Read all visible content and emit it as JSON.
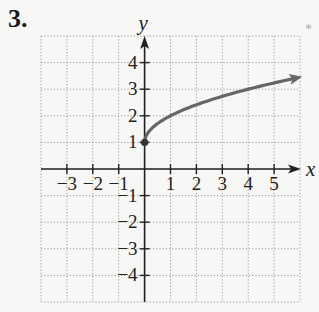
{
  "problem": {
    "number": "3.",
    "marker": "*"
  },
  "chart_data": {
    "type": "line",
    "title": "",
    "xlabel": "x",
    "ylabel": "y",
    "xlim": [
      -4,
      6
    ],
    "ylim": [
      -5,
      5
    ],
    "grid": true,
    "grid_style": "dotted",
    "x_ticks": [
      -3,
      -2,
      -1,
      1,
      2,
      3,
      4,
      5
    ],
    "x_tick_labels": [
      "−3",
      "−2",
      "−1",
      "1",
      "2",
      "3",
      "4",
      "5"
    ],
    "y_ticks": [
      4,
      3,
      2,
      1,
      -1,
      -2,
      -3,
      -4
    ],
    "y_tick_labels": [
      "4",
      "3",
      "2",
      "1",
      "−1",
      "−2",
      "−3",
      "−4"
    ],
    "series": [
      {
        "name": "f(x) = √x + 1",
        "start_point": {
          "x": 0,
          "y": 1,
          "closed": true
        },
        "end": "arrow",
        "x": [
          0,
          0.25,
          0.5,
          1,
          1.5,
          2,
          2.5,
          3,
          3.5,
          4,
          4.5,
          5,
          5.5,
          5.9
        ],
        "y": [
          1,
          1.5,
          1.71,
          2,
          2.22,
          2.41,
          2.58,
          2.73,
          2.87,
          3,
          3.12,
          3.24,
          3.35,
          3.43
        ],
        "color": "#666666"
      }
    ],
    "colors": {
      "axis": "#222222",
      "grid": "#9a9a9a",
      "curve": "#666666"
    }
  }
}
